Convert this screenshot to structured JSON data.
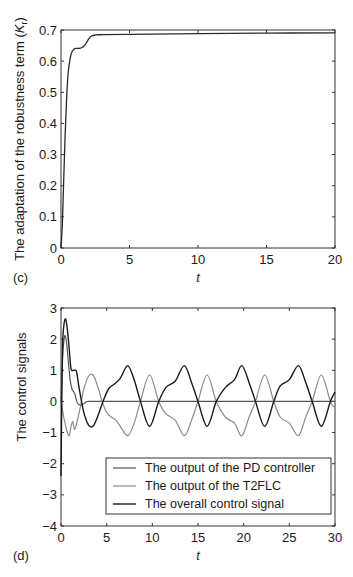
{
  "chart_data": [
    {
      "panel": "(c)",
      "type": "line",
      "title": "",
      "xlabel": "t",
      "ylabel": "The adaptation of the robustness term (K_r)",
      "ylabel_main": "The adaptation of the robustness term (",
      "ylabel_symbol": "K",
      "ylabel_sub": "r",
      "ylabel_close": ")",
      "xlim": [
        0,
        20
      ],
      "ylim": [
        0,
        0.7
      ],
      "xticks": [
        0,
        5,
        10,
        15,
        20
      ],
      "yticks": [
        0,
        0.1,
        0.2,
        0.3,
        0.4,
        0.5,
        0.6,
        0.7
      ],
      "xtick_labels": [
        "0",
        "5",
        "10",
        "15",
        "20"
      ],
      "ytick_labels": [
        "0",
        "0.1",
        "0.2",
        "0.3",
        "0.4",
        "0.5",
        "0.6",
        "0.7"
      ],
      "grid": false,
      "series": [
        {
          "name": "K_r",
          "color": "#2a2a2a",
          "x": [
            0,
            0.1,
            0.2,
            0.3,
            0.4,
            0.5,
            0.6,
            0.7,
            0.8,
            0.9,
            1.0,
            1.2,
            1.4,
            1.6,
            1.8,
            2.0,
            2.2,
            2.5,
            3,
            5,
            10,
            15,
            20
          ],
          "y": [
            0,
            0.08,
            0.22,
            0.36,
            0.47,
            0.55,
            0.59,
            0.615,
            0.63,
            0.636,
            0.64,
            0.641,
            0.642,
            0.645,
            0.655,
            0.67,
            0.68,
            0.684,
            0.685,
            0.686,
            0.688,
            0.69,
            0.691
          ]
        }
      ]
    },
    {
      "panel": "(d)",
      "type": "line",
      "title": "",
      "xlabel": "t",
      "ylabel": "The control signals",
      "xlim": [
        0,
        30
      ],
      "ylim": [
        -4,
        3
      ],
      "xticks": [
        0,
        5,
        10,
        15,
        20,
        25,
        30
      ],
      "yticks": [
        -4,
        -3,
        -2,
        -1,
        0,
        1,
        2,
        3
      ],
      "xtick_labels": [
        "0",
        "5",
        "10",
        "15",
        "20",
        "25",
        "30"
      ],
      "ytick_labels": [
        "−4",
        "−3",
        "−2",
        "−1",
        "0",
        "1",
        "2",
        "3"
      ],
      "grid": false,
      "legend_position": "lower right",
      "series": [
        {
          "name": "The output of the PD controller",
          "color": "#555555",
          "x": [
            0,
            0.2,
            0.4,
            0.6,
            0.8,
            1.0,
            1.2,
            1.5,
            1.8,
            2.2,
            2.6,
            3,
            5,
            10,
            20,
            30
          ],
          "y": [
            0,
            1.5,
            2.1,
            1.9,
            1.3,
            0.7,
            0.4,
            0.25,
            -0.05,
            -0.12,
            -0.05,
            0,
            0,
            0,
            0,
            0
          ]
        },
        {
          "name": "The output of the T2FLC",
          "color": "#8a8a8a",
          "x": [
            0,
            0.3,
            0.6,
            0.9,
            1.1,
            1.3,
            1.5,
            1.8,
            2.1,
            2.5,
            3.0,
            3.5,
            4.0,
            4.5,
            5.0,
            5.5,
            6.0,
            6.5,
            7.3,
            8.0,
            8.7,
            9.7,
            10.7,
            11.5,
            12.5,
            13.5,
            14.3,
            15.0,
            16.0,
            17.0,
            18.0,
            19.0,
            19.8,
            20.6,
            21.3,
            22.3,
            23.3,
            24.0,
            25.0,
            26.0,
            26.8,
            27.5,
            28.5,
            29.5,
            30
          ],
          "y": [
            0,
            -0.5,
            -0.9,
            -1.1,
            -0.8,
            -0.65,
            -0.9,
            -0.6,
            -0.2,
            0.4,
            0.8,
            0.85,
            0.5,
            0.0,
            -0.35,
            -0.5,
            -0.6,
            -0.8,
            -1.1,
            -0.7,
            0.0,
            0.85,
            0.0,
            -0.4,
            -0.6,
            -1.1,
            -0.6,
            0.0,
            0.85,
            0.0,
            -0.5,
            -0.7,
            -1.1,
            -0.5,
            0.0,
            0.85,
            0.0,
            -0.5,
            -0.7,
            -1.1,
            -0.5,
            0.0,
            0.85,
            0.0,
            -0.2
          ]
        },
        {
          "name": "The overall control signal",
          "color": "#1a1a1a",
          "x": [
            0,
            0.15,
            0.3,
            0.5,
            0.7,
            0.9,
            1.1,
            1.4,
            1.7,
            2.0,
            2.5,
            3.0,
            3.5,
            4.0,
            4.6,
            5.2,
            5.8,
            6.5,
            7.3,
            8.0,
            8.7,
            9.7,
            10.7,
            11.5,
            12.5,
            13.5,
            14.3,
            15.0,
            16.0,
            17.0,
            18.0,
            19.0,
            19.8,
            20.6,
            21.3,
            22.3,
            23.3,
            24.0,
            25.0,
            26.0,
            26.8,
            27.5,
            28.5,
            29.5,
            30
          ],
          "y": [
            -2.4,
            1.5,
            2.4,
            2.65,
            2.3,
            1.7,
            1.05,
            1.0,
            0.95,
            0.4,
            -0.35,
            -0.75,
            -0.8,
            -0.5,
            0.0,
            0.4,
            0.55,
            0.75,
            1.15,
            0.7,
            0.0,
            -0.8,
            0.0,
            0.45,
            0.65,
            1.15,
            0.6,
            0.0,
            -0.8,
            0.0,
            0.45,
            0.7,
            1.15,
            0.6,
            0.0,
            -0.8,
            0.0,
            0.5,
            0.7,
            1.15,
            0.6,
            0.0,
            -0.8,
            0.0,
            0.3
          ]
        }
      ]
    }
  ],
  "panels": {
    "c": {
      "label": "(c)",
      "xlabel": "t"
    },
    "d": {
      "label": "(d)",
      "xlabel": "t",
      "ylabel": "The control signals"
    }
  },
  "legend": {
    "items": [
      {
        "label": "The output of the PD controller",
        "color": "#555555"
      },
      {
        "label": "The output of the T2FLC",
        "color": "#8a8a8a"
      },
      {
        "label": "The overall control signal",
        "color": "#1a1a1a"
      }
    ]
  }
}
